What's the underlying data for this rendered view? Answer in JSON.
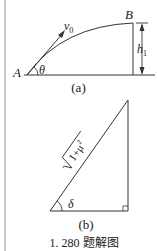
{
  "figure_a": {
    "label": "(a)",
    "point_a": "A",
    "point_b": "B",
    "angle": "θ",
    "velocity": "v",
    "velocity_sub": "0",
    "height": "h",
    "height_sub": "1"
  },
  "figure_b": {
    "label": "(b)",
    "hypotenuse": "√1+μ²",
    "hypotenuse_radicand": "1+μ",
    "hypotenuse_power": "2",
    "angle": "δ"
  },
  "caption": "1. 280 题解图",
  "colors": {
    "line": "#333333",
    "rule": "#aaaaaa"
  }
}
